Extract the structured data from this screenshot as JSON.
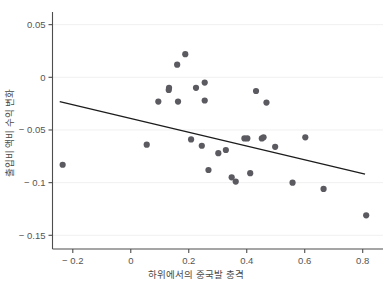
{
  "figure": {
    "partial_top_text": "",
    "background_color": "#ffffff",
    "point_color": "#5a5a60",
    "line_color": "#1c1c1c",
    "grid_color": "#f0f0f0",
    "axis_color": "#4d4d4d"
  },
  "chart_data": {
    "type": "scatter",
    "title": "",
    "xlabel": "하위에서의 중국발 충격",
    "ylabel": "출입비 액비 수익 변화",
    "xlim": [
      -0.27,
      0.87
    ],
    "ylim": [
      -0.163,
      0.062
    ],
    "xticks": [
      -0.2,
      0,
      0.2,
      0.4,
      0.6,
      0.8
    ],
    "xticklabels": [
      "− 0.2",
      "0",
      "0.2",
      "0.4",
      "0.6",
      "0.8"
    ],
    "yticks": [
      0.05,
      0,
      -0.05,
      -0.1,
      -0.15
    ],
    "yticklabels": [
      "0.05",
      "0",
      "− 0.05",
      "− 0.1",
      "− 0.15"
    ],
    "grid": true,
    "grid_axis": "y",
    "legend": "none",
    "points": [
      {
        "x": -0.235,
        "y": -0.083
      },
      {
        "x": 0.095,
        "y": -0.023
      },
      {
        "x": 0.055,
        "y": -0.064
      },
      {
        "x": 0.131,
        "y": -0.012
      },
      {
        "x": 0.188,
        "y": 0.022
      },
      {
        "x": 0.132,
        "y": -0.01
      },
      {
        "x": 0.16,
        "y": 0.012
      },
      {
        "x": 0.225,
        "y": -0.01
      },
      {
        "x": 0.255,
        "y": -0.005
      },
      {
        "x": 0.432,
        "y": -0.013
      },
      {
        "x": 0.163,
        "y": -0.023
      },
      {
        "x": 0.255,
        "y": -0.022
      },
      {
        "x": 0.468,
        "y": -0.024
      },
      {
        "x": 0.208,
        "y": -0.059
      },
      {
        "x": 0.245,
        "y": -0.065
      },
      {
        "x": 0.302,
        "y": -0.072
      },
      {
        "x": 0.328,
        "y": -0.069
      },
      {
        "x": 0.392,
        "y": -0.058
      },
      {
        "x": 0.402,
        "y": -0.058
      },
      {
        "x": 0.452,
        "y": -0.058
      },
      {
        "x": 0.458,
        "y": -0.057
      },
      {
        "x": 0.498,
        "y": -0.066
      },
      {
        "x": 0.602,
        "y": -0.057
      },
      {
        "x": 0.268,
        "y": -0.088
      },
      {
        "x": 0.348,
        "y": -0.095
      },
      {
        "x": 0.362,
        "y": -0.099
      },
      {
        "x": 0.412,
        "y": -0.091
      },
      {
        "x": 0.558,
        "y": -0.1
      },
      {
        "x": 0.665,
        "y": -0.106
      },
      {
        "x": 0.812,
        "y": -0.131
      }
    ],
    "trend_line": {
      "x_start": -0.245,
      "y_start": -0.023,
      "x_end": 0.808,
      "y_end": -0.092,
      "style": "solid"
    }
  }
}
